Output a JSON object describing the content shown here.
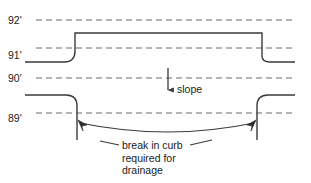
{
  "diagram": {
    "colors": {
      "stroke": "#3a3a3a",
      "dashed": "#6b6b6b",
      "text": "#1a1a1a",
      "background": "#ffffff"
    },
    "elevation_labels": [
      {
        "id": "elev-92",
        "text": "92'",
        "x": 8,
        "y": 24,
        "line_y": 20
      },
      {
        "id": "elev-91",
        "text": "91'",
        "x": 8,
        "y": 59,
        "line_y": 48
      },
      {
        "id": "elev-90",
        "text": "90'",
        "x": 8,
        "y": 82,
        "line_y": 78
      },
      {
        "id": "elev-89",
        "text": "89'",
        "x": 8,
        "y": 122,
        "line_y": 113
      }
    ],
    "dashed_lines": [
      {
        "id": "grid-92",
        "y": 20,
        "x1": 36,
        "x2": 296
      },
      {
        "id": "grid-91",
        "y": 48,
        "x1": 36,
        "x2": 296
      },
      {
        "id": "grid-90",
        "y": 78,
        "x1": 36,
        "x2": 296
      },
      {
        "id": "grid-89",
        "y": 113,
        "x1": 36,
        "x2": 296
      }
    ],
    "upper_curb": {
      "id": "upper-curb-profile",
      "path": "M 25 62 L 64 62 Q 75 62 75 51 L 75 33 L 262 33 L 262 56 Q 262 62 270 62 L 295 62"
    },
    "lower_curb_left": {
      "id": "lower-curb-left-profile",
      "path": "M 25 95 L 66 95 Q 77 95 77 106 L 77 140"
    },
    "lower_curb_right": {
      "id": "lower-curb-right-profile",
      "path": "M 295 95 L 268 95 Q 257 95 257 106 L 257 140"
    },
    "slope_arrow": {
      "id": "slope-arrow",
      "label": "slope",
      "x": 168,
      "y_top": 68,
      "y_bottom": 95,
      "label_x": 176,
      "label_y": 92
    },
    "break_arc": {
      "id": "break-in-curb-arc",
      "path": "M 79 122 Q 168 140 255 122",
      "left_arrow_x": 79,
      "left_arrow_y": 122,
      "right_arrow_x": 255,
      "right_arrow_y": 122
    },
    "caption": {
      "id": "break-caption",
      "x": 122,
      "y": 148,
      "line_height": 12.5,
      "lines": [
        "break in curb",
        "required for",
        "drainage"
      ]
    }
  }
}
